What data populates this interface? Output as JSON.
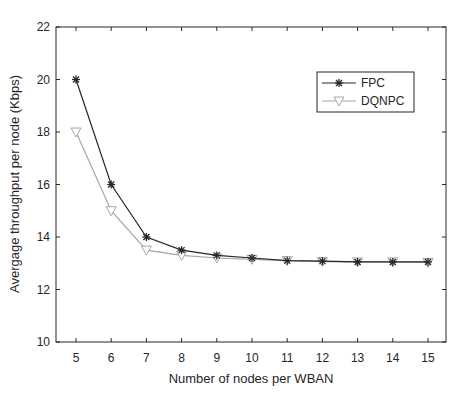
{
  "chart_data": {
    "type": "line",
    "title": "",
    "xlabel": "Number of nodes per WBAN",
    "ylabel": "Avergage throughput per node (Kbps)",
    "x": [
      5,
      6,
      7,
      8,
      9,
      10,
      11,
      12,
      13,
      14,
      15
    ],
    "xlim": [
      4.8,
      15.4
    ],
    "ylim": [
      10,
      22
    ],
    "xticks": [
      5,
      6,
      7,
      8,
      9,
      10,
      11,
      12,
      13,
      14,
      15
    ],
    "yticks": [
      10,
      12,
      14,
      16,
      18,
      20,
      22
    ],
    "grid": false,
    "legend_position": "upper right",
    "series": [
      {
        "name": "FPC",
        "marker": "asterisk",
        "color": "#262626",
        "values": [
          20,
          16,
          14,
          13.5,
          13.3,
          13.2,
          13.1,
          13.08,
          13.05,
          13.05,
          13.05
        ]
      },
      {
        "name": "DQNPC",
        "marker": "triangle-down",
        "color": "#a6a6a6",
        "values": [
          18,
          15,
          13.5,
          13.3,
          13.2,
          13.15,
          13.1,
          13.06,
          13.05,
          13.05,
          13.03
        ]
      }
    ]
  }
}
